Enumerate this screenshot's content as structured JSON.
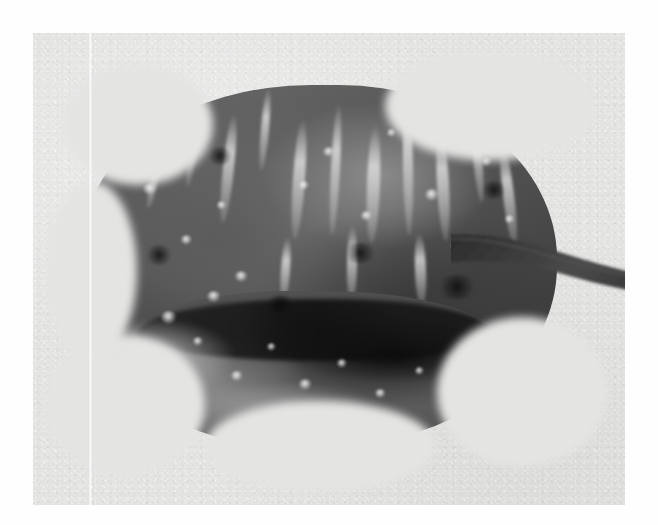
{
  "figure": {
    "domain": "scientific-photographic-plate",
    "medium": "black-and-white halftone photograph",
    "caption": "",
    "label": "",
    "scale_bar": "",
    "visible_text": []
  },
  "page": {
    "background_color": "#fefefe",
    "width_px": 658,
    "height_px": 525
  },
  "plate": {
    "name": "photographic-field",
    "background_color": "#e4e4e3",
    "left_px": 33,
    "top_px": 33,
    "width_px": 592,
    "height_px": 472,
    "grain": "visible film grain",
    "artifact": {
      "name": "vertical-white-line",
      "description": "faint white scratch line running the full height of the plate",
      "x_px": 89,
      "color": "#ffffff"
    }
  },
  "specimen": {
    "name": "specimen",
    "description": "rounded textured body with a deep dark transverse groove and a tapering stalk extending to the right",
    "orientation": "stalk to the right",
    "bounding_box_px": {
      "left": 85,
      "top": 88,
      "right": 625,
      "bottom": 432
    },
    "parts": [
      {
        "name": "main-body",
        "description": "broad rounded upper lobe with vertical striations and mottled texture"
      },
      {
        "name": "transverse-groove",
        "description": "dark horizontal furrow separating upper and lower lobes"
      },
      {
        "name": "lower-lobe",
        "description": "narrower rounded lower margin with bright speckled highlights"
      },
      {
        "name": "stalk",
        "description": "dark tapering stalk projecting right to the edge of the field"
      }
    ],
    "tones": {
      "darkest": "#101010",
      "mid": "#4e4e4e",
      "light": "#8b8b8b",
      "highlight": "#f0f0f0",
      "background": "#e4e4e3"
    }
  }
}
